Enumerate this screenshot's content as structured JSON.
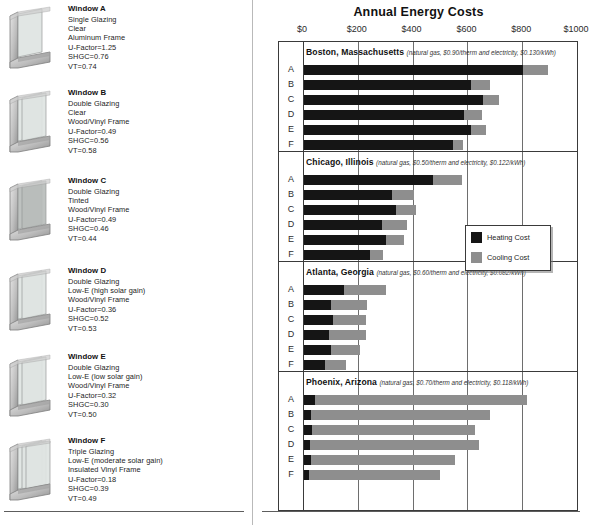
{
  "left_panel": {
    "windows": [
      {
        "id": "A",
        "title": "Window A",
        "lines": [
          "Single Glazing",
          "Clear",
          "Aluminum Frame",
          "U-Factor=1.25",
          "SHGC=0.76",
          "VT=0.74"
        ],
        "icon": "window-cross-section-single-glazing"
      },
      {
        "id": "B",
        "title": "Window B",
        "lines": [
          "Double Glazing",
          "Clear",
          "Wood/Vinyl Frame",
          "U-Factor=0.49",
          "SHGC=0.56",
          "VT=0.58"
        ],
        "icon": "window-cross-section-double-glazing"
      },
      {
        "id": "C",
        "title": "Window C",
        "lines": [
          "Double Glazing",
          "Tinted",
          "Wood/Vinyl Frame",
          "U-Factor=0.49",
          "SHGC=0.46",
          "VT=0.44"
        ],
        "icon": "window-cross-section-double-glazing-tinted"
      },
      {
        "id": "D",
        "title": "Window D",
        "lines": [
          "Double Glazing",
          "Low-E (high solar gain)",
          "Wood/Vinyl Frame",
          "U-Factor=0.36",
          "SHGC=0.52",
          "VT=0.53"
        ],
        "icon": "window-cross-section-low-e-high"
      },
      {
        "id": "E",
        "title": "Window E",
        "lines": [
          "Double Glazing",
          "Low-E (low solar gain)",
          "Wood/Vinyl Frame",
          "U-Factor=0.32",
          "SHGC=0.30",
          "VT=0.50"
        ],
        "icon": "window-cross-section-low-e-low"
      },
      {
        "id": "F",
        "title": "Window F",
        "lines": [
          "Triple Glazing",
          "Low-E (moderate solar gain)",
          "Insulated Vinyl Frame",
          "U-Factor=0.18",
          "SHGC=0.39",
          "VT=0.49"
        ],
        "icon": "window-cross-section-triple-glazing"
      }
    ]
  },
  "chart_data": {
    "type": "bar",
    "orientation": "horizontal",
    "stacked": true,
    "title": "Annual Energy Costs",
    "xlabel": "",
    "ylabel": "",
    "xlim": [
      0,
      1000
    ],
    "xticks": [
      0,
      200,
      400,
      600,
      800,
      1000
    ],
    "xtick_labels": [
      "$0",
      "$200",
      "$400",
      "$600",
      "$800",
      "$1000"
    ],
    "grid": true,
    "grid_axis": "x",
    "legend_position": "middle-right",
    "legend": [
      {
        "name": "Heating Cost",
        "color": "#151515"
      },
      {
        "name": "Cooling Cost",
        "color": "#8e8e8e"
      }
    ],
    "categories": [
      "A",
      "B",
      "C",
      "D",
      "E",
      "F"
    ],
    "groups": [
      {
        "name": "Boston, Massachusetts",
        "annotation": "(natural gas, $0.90/therm and electricity, $0.130/kWh)",
        "series": [
          {
            "name": "Heating Cost",
            "values": [
              800,
              610,
              655,
              585,
              610,
              545
            ]
          },
          {
            "name": "Cooling Cost",
            "values": [
              90,
              70,
              55,
              65,
              55,
              35
            ]
          }
        ],
        "totals": [
          890,
          680,
          710,
          650,
          665,
          580
        ]
      },
      {
        "name": "Chicago, Illinois",
        "annotation": "(natural gas, $0.50/therm and electricity, $0.122/kWh)",
        "series": [
          {
            "name": "Heating Cost",
            "values": [
              470,
              320,
              335,
              285,
              300,
              240
            ]
          },
          {
            "name": "Cooling Cost",
            "values": [
              105,
              80,
              75,
              90,
              65,
              50
            ]
          }
        ],
        "totals": [
          575,
          400,
          410,
          375,
          365,
          290
        ]
      },
      {
        "name": "Atlanta, Georgia",
        "annotation": "(natural gas, $0.60/therm and electricity, $0.082/kWh)",
        "series": [
          {
            "name": "Heating Cost",
            "values": [
              145,
              100,
              105,
              90,
              100,
              75
            ]
          },
          {
            "name": "Cooling Cost",
            "values": [
              155,
              130,
              120,
              135,
              105,
              80
            ]
          }
        ],
        "totals": [
          300,
          230,
          225,
          225,
          205,
          155
        ]
      },
      {
        "name": "Phoenix, Arizona",
        "annotation": "(natural gas, $0.70/therm and electricity, $0.118/kWh)",
        "series": [
          {
            "name": "Heating Cost",
            "values": [
              40,
              25,
              30,
              22,
              25,
              20
            ]
          },
          {
            "name": "Cooling Cost",
            "values": [
              775,
              655,
              595,
              615,
              525,
              475
            ]
          }
        ],
        "totals": [
          815,
          680,
          625,
          637,
          550,
          495
        ]
      }
    ]
  }
}
